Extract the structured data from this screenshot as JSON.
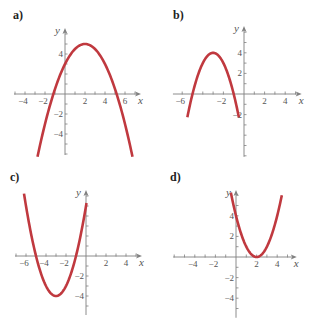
{
  "chart_data": [
    {
      "type": "line",
      "panel": "a)",
      "equation": "y = -0.5(x - 2)^2 + 5",
      "vertex": [
        2,
        5
      ],
      "x_intercepts": [
        -1.16,
        5.16
      ],
      "y_intercept": 3,
      "x_range": [
        -2.8,
        6.8
      ],
      "xlabel": "x",
      "ylabel": "y",
      "x_tick_labels": [
        "-4",
        "-2",
        "2",
        "4",
        "6"
      ],
      "y_tick_labels": [
        "4",
        "-2",
        "-4"
      ],
      "xlim": [
        -5,
        7.6
      ],
      "ylim": [
        -6.2,
        6.6
      ],
      "curve_color": "#c0393f"
    },
    {
      "type": "line",
      "panel": "b)",
      "equation": "y = -(x + 3)^2 + 4",
      "vertex": [
        -3,
        4
      ],
      "x_intercepts": [
        -5,
        -1
      ],
      "x_range": [
        -5.5,
        -0.5
      ],
      "xlabel": "x",
      "ylabel": "y",
      "x_tick_labels": [
        "-6",
        "-2",
        "2",
        "4"
      ],
      "y_tick_labels": [
        "4",
        "2",
        "-2"
      ],
      "xlim": [
        -7,
        5.8
      ],
      "ylim": [
        -6.2,
        6.6
      ],
      "curve_color": "#c0393f"
    },
    {
      "type": "line",
      "panel": "c)",
      "equation": "y = (x + 3)^2 - 4",
      "vertex": [
        -3,
        -4
      ],
      "x_intercepts": [
        -5,
        -1
      ],
      "y_intercept": 5,
      "x_range": [
        -6.2,
        0.1
      ],
      "xlabel": "x",
      "ylabel": "y",
      "x_tick_labels": [
        "-6",
        "-4",
        "-2",
        "2",
        "4"
      ],
      "y_tick_labels": [
        "-2",
        "-4"
      ],
      "xlim": [
        -7,
        5.6
      ],
      "ylim": [
        -6,
        6.6
      ],
      "curve_color": "#c0393f"
    },
    {
      "type": "line",
      "panel": "d)",
      "equation": "y = (x - 2)^2",
      "vertex": [
        2,
        0
      ],
      "x_intercepts": [
        2
      ],
      "y_intercept": 4,
      "x_range": [
        -0.5,
        4.5
      ],
      "xlabel": "x",
      "ylabel": "y",
      "x_tick_labels": [
        "-4",
        "-2",
        "2",
        "4"
      ],
      "y_tick_labels": [
        "4",
        "2",
        "-2",
        "-4"
      ],
      "xlim": [
        -6.2,
        6.2
      ],
      "ylim": [
        -6,
        6.6
      ],
      "curve_color": "#c0393f"
    }
  ],
  "panels": [
    {
      "label": "a)",
      "label_pos": [
        13,
        9
      ],
      "origin": [
        65,
        94
      ],
      "scale": 10,
      "x_axis": [
        -5.1,
        7.6
      ],
      "y_axis": [
        -6.1,
        6.6
      ],
      "x_ticks": [
        -5,
        -4,
        -3,
        -2,
        -1,
        1,
        2,
        3,
        4,
        5,
        6,
        7
      ],
      "y_ticks": [
        -6,
        -5,
        -4,
        -3,
        -2,
        -1,
        1,
        2,
        3,
        4,
        5,
        6
      ],
      "x_labels": [
        {
          "v": -4,
          "t": "−4"
        },
        {
          "v": -2,
          "t": "−2"
        },
        {
          "v": 2,
          "t": "2"
        },
        {
          "v": 4,
          "t": "4"
        },
        {
          "v": 6,
          "t": "6"
        }
      ],
      "y_labels": [
        {
          "v": 4,
          "t": "4"
        },
        {
          "v": -2,
          "t": "−2"
        },
        {
          "v": -4,
          "t": "−4"
        }
      ],
      "curve": {
        "a": -0.5,
        "h": 2,
        "k": 5,
        "x0": -2.75,
        "x1": 6.75
      }
    },
    {
      "label": "b)",
      "label_pos": [
        173,
        9
      ],
      "origin": [
        244,
        94
      ],
      "scale": 10.3,
      "x_axis": [
        -6.9,
        5.6
      ],
      "y_axis": [
        -6.1,
        6.6
      ],
      "x_ticks": [
        -6,
        -5,
        -4,
        -3,
        -2,
        -1,
        1,
        2,
        3,
        4,
        5
      ],
      "y_ticks": [
        -6,
        -5,
        -4,
        -3,
        -2,
        -1,
        1,
        2,
        3,
        4,
        5,
        6
      ],
      "x_labels": [
        {
          "v": -6,
          "t": "−6"
        },
        {
          "v": -2,
          "t": "−2"
        },
        {
          "v": 2,
          "t": "2"
        },
        {
          "v": 4,
          "t": "4"
        }
      ],
      "y_labels": [
        {
          "v": 4,
          "t": "4"
        },
        {
          "v": 2,
          "t": "2"
        },
        {
          "v": -2,
          "t": "−2"
        }
      ],
      "curve": {
        "a": -1,
        "h": -3,
        "k": 4,
        "x0": -5.5,
        "x1": -0.5
      }
    },
    {
      "label": "c)",
      "label_pos": [
        10,
        171
      ],
      "origin": [
        86,
        256
      ],
      "scale": 10,
      "x_axis": [
        -7.1,
        5.6
      ],
      "y_axis": [
        -5.9,
        6.6
      ],
      "x_ticks": [
        -7,
        -6,
        -5,
        -4,
        -3,
        -2,
        -1,
        1,
        2,
        3,
        4,
        5
      ],
      "y_ticks": [
        -5,
        -4,
        -3,
        -2,
        -1,
        1,
        2,
        3,
        4,
        5,
        6
      ],
      "x_labels": [
        {
          "v": -6,
          "t": "−6"
        },
        {
          "v": -4,
          "t": "−4"
        },
        {
          "v": -2,
          "t": "−2"
        },
        {
          "v": 2,
          "t": "2"
        },
        {
          "v": 4,
          "t": "4"
        }
      ],
      "y_labels": [
        {
          "v": -2,
          "t": "−2"
        },
        {
          "v": -4,
          "t": "−4"
        }
      ],
      "curve": {
        "a": 1,
        "h": -3,
        "k": -4,
        "x0": -6.2,
        "x1": 0.05
      }
    },
    {
      "label": "d)",
      "label_pos": [
        170,
        171
      ],
      "origin": [
        236,
        257
      ],
      "scale": 10.3,
      "x_axis": [
        -6.1,
        5.9
      ],
      "y_axis": [
        -5.9,
        6.5
      ],
      "x_ticks": [
        -6,
        -5,
        -4,
        -3,
        -2,
        -1,
        1,
        2,
        3,
        4,
        5
      ],
      "y_ticks": [
        -5,
        -4,
        -3,
        -2,
        -1,
        1,
        2,
        3,
        4,
        5,
        6
      ],
      "x_labels": [
        {
          "v": -4,
          "t": "−4"
        },
        {
          "v": -2,
          "t": "−2"
        },
        {
          "v": 2,
          "t": "2"
        },
        {
          "v": 4,
          "t": "4"
        }
      ],
      "y_labels": [
        {
          "v": 4,
          "t": "4"
        },
        {
          "v": 2,
          "t": "2"
        },
        {
          "v": -2,
          "t": "−2"
        },
        {
          "v": -4,
          "t": "−4"
        }
      ],
      "curve": {
        "a": 1,
        "h": 2,
        "k": 0,
        "x0": -0.5,
        "x1": 4.45
      }
    }
  ],
  "axis_names": {
    "x": "x",
    "y": "y"
  },
  "colors": {
    "curve": "#c0393f",
    "axis": "#808080",
    "tick_text": "#555555",
    "label_text": "#222222"
  }
}
